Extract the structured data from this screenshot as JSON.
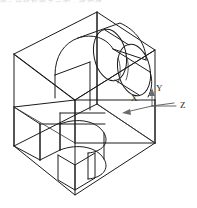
{
  "figure": {
    "title_artifact": "图2  用线框图表示的三维实体",
    "type": "isometric-wireframe-technical-drawing",
    "line_color": "#1c1c1c",
    "axis_color": "#555555",
    "background": "#ffffff"
  },
  "axes": {
    "x": {
      "label": "X",
      "x": 131,
      "y": 101
    },
    "y": {
      "label": "Y",
      "x": 160,
      "y": 97
    },
    "z": {
      "label": "Z",
      "x": 180,
      "y": 110
    }
  },
  "geometry": {
    "outer_box": {
      "comment": "isometric box vertices in screen px",
      "top_apex": [
        97,
        12
      ],
      "left_top": [
        14,
        54
      ],
      "right_top": [
        155,
        50
      ],
      "front_mid": [
        75,
        100
      ],
      "left_bottom": [
        14,
        146
      ],
      "right_bottom": [
        155,
        143
      ],
      "bottom_apex": [
        75,
        195
      ]
    },
    "upper_feature": {
      "name": "cylindrical-through-hole",
      "ellipse_rx": 17,
      "ellipse_ry": 26
    },
    "lower_feature": {
      "name": "rectangular-slot-with-rounded-end",
      "arc_radius": 22
    }
  }
}
